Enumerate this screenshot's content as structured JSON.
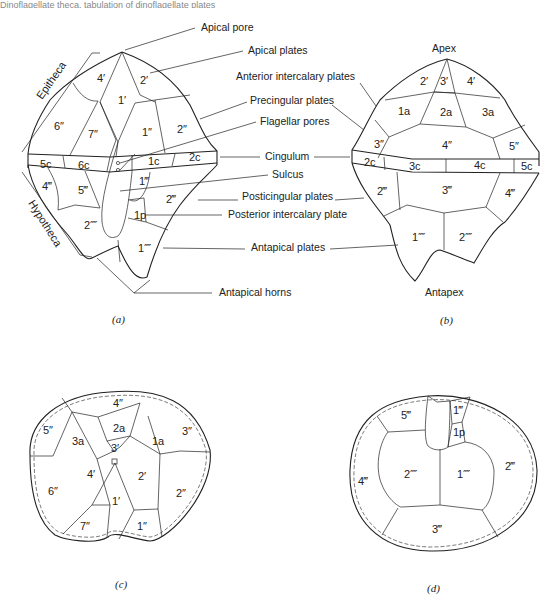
{
  "header": {
    "running_text": "Dinoflagellate theca, tabulation of dinoflagellate plates"
  },
  "figure_a": {
    "caption": "(a)",
    "side_labels": {
      "epitheca": "Epitheca",
      "hypotheca": "Hypotheca"
    },
    "plates": {
      "p4ap": "4′",
      "p2ap": "2′",
      "p1ap": "1′",
      "p6pre": "6″",
      "p7pre": "7″",
      "p1pre": "1″",
      "p2pre": "2″",
      "c5": "5c",
      "c6": "6c",
      "c1": "1c",
      "c2": "2c",
      "p4post": "4‴",
      "p5post": "5‴",
      "p1post": "1‴",
      "p2post": "2‴",
      "p2ant": "2⁗",
      "p1ant": "1⁗",
      "p1p": "1p"
    }
  },
  "callouts": {
    "apical_pore": "Apical pore",
    "apical_plates": "Apical plates",
    "anterior_intercalary": "Anterior intercalary plates",
    "precingular": "Precingular plates",
    "flagellar_pores": "Flagellar pores",
    "cingulum": "Cingulum",
    "sulcus": "Sulcus",
    "posticingular": "Posticingular plates",
    "posterior_intercalary": "Posterior intercalary plate",
    "antapical_plates": "Antapical plates",
    "antapical_horns": "Antapical horns"
  },
  "figure_b": {
    "caption": "(b)",
    "apex": "Apex",
    "antapex": "Antapex",
    "plates": {
      "p2ap": "2′",
      "p3ap": "3′",
      "p4ap": "4′",
      "a1": "1a",
      "a2": "2a",
      "a3": "3a",
      "p3pre": "3″",
      "p4pre": "4″",
      "p5pre": "5″",
      "c2": "2c",
      "c3": "3c",
      "c4": "4c",
      "c5": "5c",
      "p2post": "2‴",
      "p3post": "3‴",
      "p4post": "4‴",
      "p1ant": "1⁗",
      "p2ant": "2⁗"
    }
  },
  "figure_c": {
    "caption": "(c)",
    "plates": {
      "p4pre": "4″",
      "a2": "2a",
      "p5pre": "5″",
      "a3": "3a",
      "p3ap": "3′",
      "a1": "1a",
      "p3pre": "3″",
      "p4ap": "4′",
      "p2ap": "2′",
      "p6pre": "6″",
      "p1ap": "1′",
      "p2pre": "2″",
      "p7pre": "7″",
      "p1pre": "1″"
    }
  },
  "figure_d": {
    "caption": "(d)",
    "plates": {
      "p5post": "5‴",
      "p1post": "1‴",
      "p1p": "1p",
      "p4post": "4‴",
      "p2ant": "2⁗",
      "p1ant": "1⁗",
      "p2post": "2‴",
      "p3post": "3‴"
    }
  }
}
